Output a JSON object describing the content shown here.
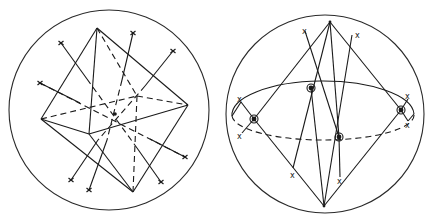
{
  "figure": {
    "panels": [
      {
        "id": "left",
        "description": "Octahedron inscribed in a sphere with axes through center, endpoints marked x",
        "sphere": {
          "cx": 109,
          "cy": 110,
          "r": 100
        },
        "center": {
          "x": 115,
          "y": 114
        },
        "marker": "x"
      },
      {
        "id": "right",
        "description": "Sphere with equator ellipse, poles connected to four circled points on equator, x markers",
        "sphere": {
          "cx": 325,
          "cy": 114,
          "r": 100
        },
        "markers": [
          "x",
          "x",
          "x",
          "x",
          "x",
          "x",
          "x",
          "x"
        ],
        "circled_points": 4
      }
    ],
    "labels": {
      "x": "x"
    }
  }
}
